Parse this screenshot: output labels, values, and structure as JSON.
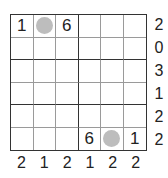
{
  "puzzle": {
    "size": 6,
    "grid": [
      [
        "1",
        "circle",
        "6",
        "",
        "",
        ""
      ],
      [
        "",
        "",
        "",
        "",
        "",
        ""
      ],
      [
        "",
        "",
        "",
        "",
        "",
        ""
      ],
      [
        "",
        "",
        "",
        "",
        "",
        ""
      ],
      [
        "",
        "",
        "",
        "",
        "",
        ""
      ],
      [
        "",
        "",
        "",
        "6",
        "circle",
        "1"
      ]
    ],
    "row_clues": [
      "2",
      "0",
      "3",
      "1",
      "2",
      "2"
    ],
    "col_clues": [
      "2",
      "1",
      "2",
      "1",
      "2",
      "2"
    ],
    "colors": {
      "circle": "#bdbdbd",
      "thick_line": "#333333",
      "thin_line": "#9a9a9a",
      "text": "#222222"
    }
  }
}
